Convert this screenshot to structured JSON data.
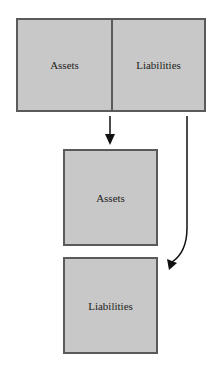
{
  "diagram": {
    "top_box": {
      "left_label": "Assets",
      "right_label": "Liabilities"
    },
    "middle_box": {
      "label": "Assets"
    },
    "bottom_box": {
      "label": "Liabilities"
    },
    "colors": {
      "fill": "#c8c8c8",
      "border": "#5a5a5a",
      "arrow": "#111111"
    }
  }
}
